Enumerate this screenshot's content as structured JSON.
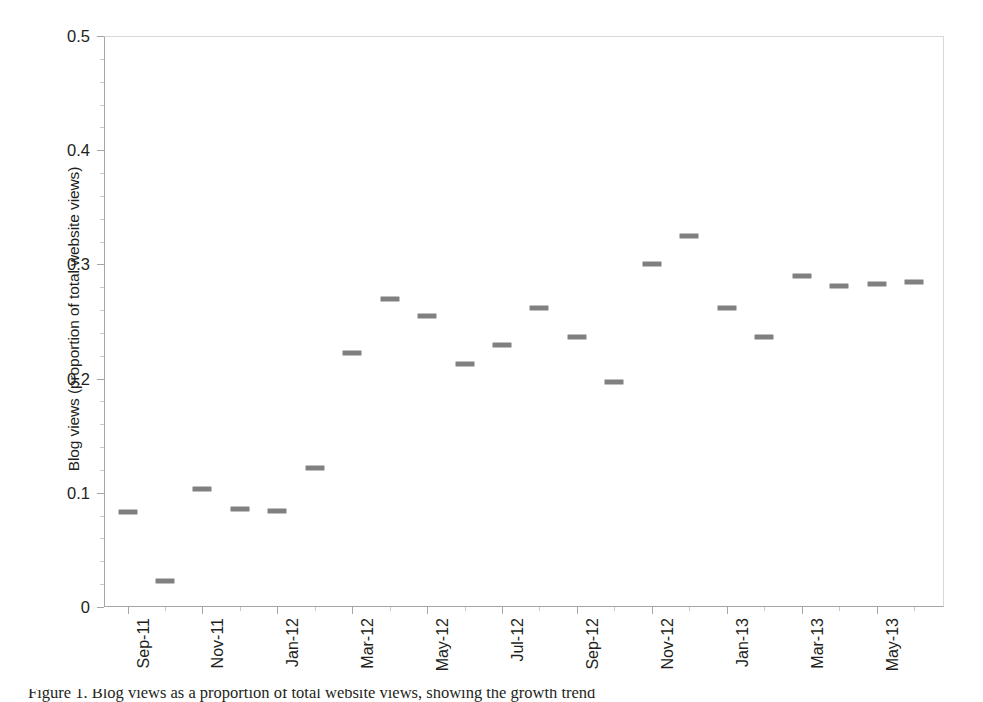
{
  "chart_data": {
    "type": "scatter",
    "title": "",
    "xlabel": "",
    "ylabel": "Blog views (proportion of total website views)",
    "ylim": [
      0,
      0.5
    ],
    "y_ticks": [
      "0",
      "0.1",
      "0.2",
      "0.3",
      "0.4",
      "0.5"
    ],
    "y_tick_values": [
      0,
      0.1,
      0.2,
      0.3,
      0.4,
      0.5
    ],
    "y_minor_interval": 0.02,
    "grid": false,
    "legend": "none",
    "marker_style": "horizontal-dash",
    "marker_color": "#808080",
    "x_tick_labels": [
      "Sep-11",
      "Nov-11",
      "Jan-12",
      "Mar-12",
      "May-12",
      "Jul-12",
      "Sep-12",
      "Nov-12",
      "Jan-13",
      "Mar-13",
      "May-13"
    ],
    "categories": [
      "Sep-11",
      "Oct-11",
      "Nov-11",
      "Dec-11",
      "Jan-12",
      "Feb-12",
      "Mar-12",
      "Apr-12",
      "May-12",
      "Jun-12",
      "Jul-12",
      "Aug-12",
      "Sep-12",
      "Oct-12",
      "Nov-12",
      "Dec-12",
      "Jan-13",
      "Feb-13",
      "Mar-13",
      "Apr-13",
      "May-13",
      "Jun-13"
    ],
    "values": [
      0.083,
      0.023,
      0.103,
      0.086,
      0.084,
      0.122,
      0.222,
      0.27,
      0.255,
      0.213,
      0.229,
      0.262,
      0.236,
      0.197,
      0.3,
      0.325,
      0.262,
      0.236,
      0.29,
      0.281,
      0.283,
      0.285
    ]
  },
  "caption": {
    "text": "Figure 1. Blog views as a proportion of total website views, showing the growth trend"
  },
  "colors": {
    "marker": "#808080",
    "axis": "#a6a6a6",
    "frame": "#d9d9d9",
    "text": "#231f20"
  }
}
